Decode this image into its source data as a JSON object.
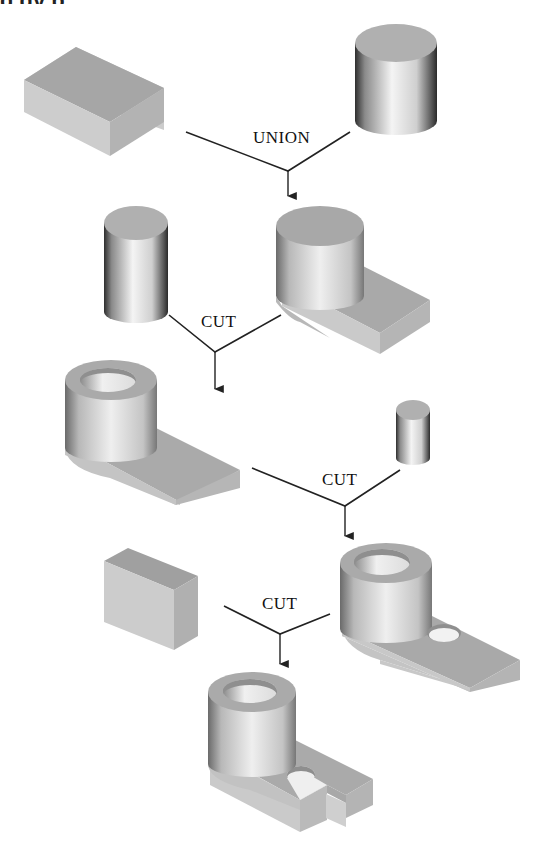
{
  "figure": {
    "heading_fragment": "g    gy      p",
    "background": "#ffffff",
    "colors": {
      "face_top": "#a8a8a8",
      "face_front": "#c8c8c8",
      "face_side": "#b4b4b4",
      "cyl_dark": "#3a3a3a",
      "cyl_light": "#f2f2f2",
      "line": "#222222"
    },
    "operations": [
      {
        "id": "op1",
        "label": "UNION",
        "inputs": [
          "rectangular block",
          "cylinder"
        ],
        "result": "block with cylinder boss"
      },
      {
        "id": "op2",
        "label": "CUT",
        "inputs": [
          "cylinder",
          "block with cylinder boss"
        ],
        "result": "boss with bore"
      },
      {
        "id": "op3",
        "label": "CUT",
        "inputs": [
          "boss with bore",
          "small cylinder"
        ],
        "result": "part with hole in base"
      },
      {
        "id": "op4",
        "label": "CUT",
        "inputs": [
          "rectangular block",
          "part with hole in base"
        ],
        "result": "slotted bracket"
      }
    ],
    "solids": [
      {
        "name": "rectangular-block",
        "stage": 1
      },
      {
        "name": "large-cylinder",
        "stage": 1
      },
      {
        "name": "medium-cylinder",
        "stage": 2
      },
      {
        "name": "union-result",
        "stage": 2
      },
      {
        "name": "bored-boss-part",
        "stage": 3
      },
      {
        "name": "small-cylinder",
        "stage": 3
      },
      {
        "name": "holed-part",
        "stage": 4
      },
      {
        "name": "cutting-block",
        "stage": 4
      },
      {
        "name": "final-slotted-part",
        "stage": 5
      }
    ]
  }
}
